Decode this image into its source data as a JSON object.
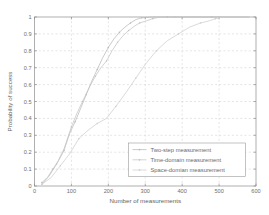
{
  "chart_data": {
    "type": "line",
    "title": "",
    "xlabel": "Number of measurements",
    "ylabel": "Probability of success",
    "xlim": [
      0,
      600
    ],
    "ylim": [
      0,
      1
    ],
    "grid": true,
    "legend_position": "lower right",
    "xticks": [
      0,
      100,
      200,
      300,
      400,
      500,
      600
    ],
    "xtick_labels": [
      "0",
      "100",
      "200",
      "300",
      "400",
      "500",
      "600"
    ],
    "yticks": [
      0,
      0.1,
      0.2,
      0.3,
      0.4,
      0.5,
      0.6,
      0.7,
      0.8,
      0.9,
      1
    ],
    "ytick_labels": [
      "0",
      "0.1",
      "0.2",
      "0.3",
      "0.4",
      "0.5",
      "0.6",
      "0.7",
      "0.8",
      "0.9",
      "1"
    ],
    "series": [
      {
        "name": "Two-step measurement",
        "color": "#b9b9b9",
        "marker": "dot",
        "x": [
          20,
          35,
          50,
          65,
          80,
          95,
          110,
          125,
          140,
          155,
          170,
          185,
          200,
          215,
          230,
          245,
          260,
          275,
          290,
          320,
          360,
          420,
          480,
          540,
          580
        ],
        "y": [
          0.02,
          0.05,
          0.1,
          0.15,
          0.21,
          0.31,
          0.38,
          0.46,
          0.54,
          0.62,
          0.69,
          0.76,
          0.82,
          0.87,
          0.91,
          0.94,
          0.965,
          0.985,
          0.995,
          1.0,
          1.0,
          1.0,
          1.0,
          1.0,
          1.0
        ]
      },
      {
        "name": "Time-domain measurement",
        "color": "#c4c4c4",
        "marker": "dot",
        "x": [
          20,
          40,
          60,
          80,
          100,
          115,
          130,
          150,
          165,
          180,
          195,
          210,
          225,
          240,
          255,
          270,
          285,
          300,
          320,
          340,
          380,
          440,
          500,
          560,
          580
        ],
        "y": [
          0.01,
          0.06,
          0.13,
          0.22,
          0.35,
          0.43,
          0.5,
          0.59,
          0.65,
          0.7,
          0.74,
          0.8,
          0.85,
          0.89,
          0.92,
          0.945,
          0.965,
          0.975,
          0.99,
          1.0,
          1.0,
          1.0,
          1.0,
          1.0,
          1.0
        ]
      },
      {
        "name": "Space-domian measurement",
        "color": "#cdcdcd",
        "marker": "dot",
        "x": [
          20,
          45,
          70,
          95,
          120,
          145,
          170,
          195,
          220,
          250,
          275,
          300,
          330,
          360,
          390,
          420,
          450,
          470,
          490,
          510,
          540,
          570,
          580
        ],
        "y": [
          0.01,
          0.05,
          0.12,
          0.19,
          0.28,
          0.33,
          0.37,
          0.4,
          0.47,
          0.56,
          0.64,
          0.72,
          0.8,
          0.86,
          0.9,
          0.94,
          0.965,
          0.975,
          0.99,
          1.0,
          1.0,
          1.0,
          1.0
        ]
      }
    ]
  },
  "legend": {
    "items": [
      {
        "label": "Two-step measurement"
      },
      {
        "label": "Time-domain measurement"
      },
      {
        "label": "Space-domian measurement"
      }
    ]
  }
}
